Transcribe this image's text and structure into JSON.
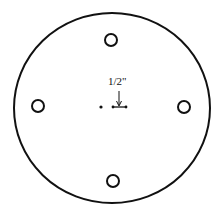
{
  "diagram": {
    "type": "circular-plate-hole-pattern",
    "outer_circle": {
      "cx": 112,
      "cy": 108,
      "rx": 98,
      "ry": 95
    },
    "holes": [
      {
        "name": "top",
        "cx": 111,
        "cy": 40,
        "r": 6
      },
      {
        "name": "left",
        "cx": 38,
        "cy": 106,
        "r": 6
      },
      {
        "name": "right",
        "cx": 184,
        "cy": 107,
        "r": 6
      },
      {
        "name": "bottom",
        "cx": 113,
        "cy": 181,
        "r": 6
      }
    ],
    "center_mark": {
      "x": 101,
      "y": 107
    },
    "dimension": {
      "label": "1/2\"",
      "label_x": 108,
      "label_y": 84
    },
    "stroke_color": "#111111"
  }
}
